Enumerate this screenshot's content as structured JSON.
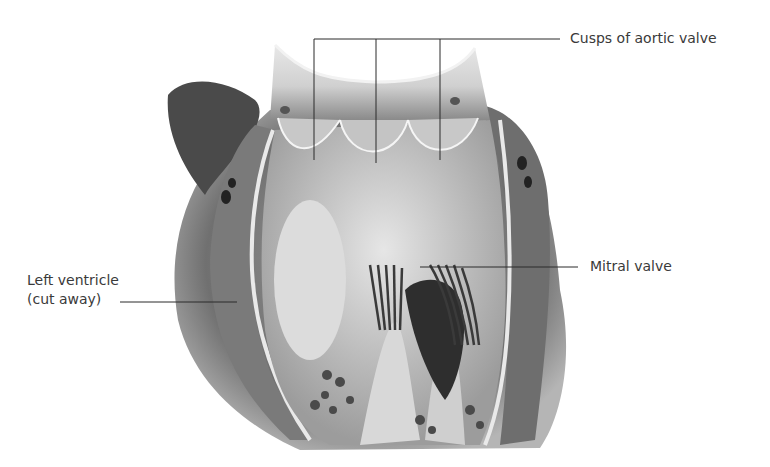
{
  "diagram": {
    "labels": {
      "cusps": "Cusps of aortic valve",
      "mitral": "Mitral valve",
      "left_ventricle_line1": "Left ventricle",
      "left_ventricle_line2": "(cut away)"
    }
  }
}
